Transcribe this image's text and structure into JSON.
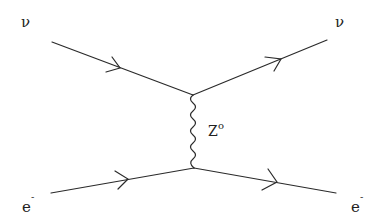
{
  "diagram": {
    "type": "feynman",
    "title": "",
    "line_color": "#2a2a2a",
    "particles": {
      "nu_in": {
        "symbol": "ν"
      },
      "nu_out": {
        "symbol": "ν"
      },
      "e_in": {
        "symbol": "e",
        "charge": "-"
      },
      "e_out": {
        "symbol": "e",
        "charge": "-"
      }
    },
    "propagator": {
      "symbol": "Z",
      "superscript": "o",
      "style": "wavy"
    },
    "vertices": [
      {
        "id": "top",
        "x": 193,
        "y": 95
      },
      {
        "id": "bottom",
        "x": 194,
        "y": 168
      }
    ],
    "edges": [
      {
        "from": "nu_in",
        "to": "top",
        "style": "fermion-arrow"
      },
      {
        "from": "top",
        "to": "nu_out",
        "style": "fermion-arrow"
      },
      {
        "from": "e_in",
        "to": "bottom",
        "style": "fermion-arrow"
      },
      {
        "from": "bottom",
        "to": "e_out",
        "style": "fermion-arrow"
      },
      {
        "from": "top",
        "to": "bottom",
        "style": "wavy",
        "label": "Z°"
      }
    ]
  }
}
